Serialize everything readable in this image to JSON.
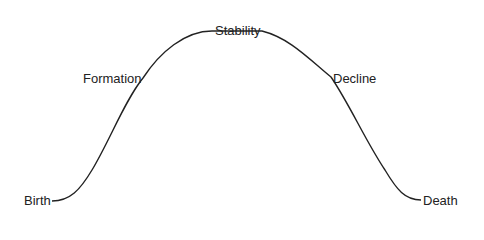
{
  "diagram": {
    "type": "life-cycle curve",
    "stages": [
      {
        "label": "Birth"
      },
      {
        "label": "Formation"
      },
      {
        "label": "Stability"
      },
      {
        "label": "Decline"
      },
      {
        "label": "Death"
      }
    ],
    "line_color": "#222222"
  }
}
